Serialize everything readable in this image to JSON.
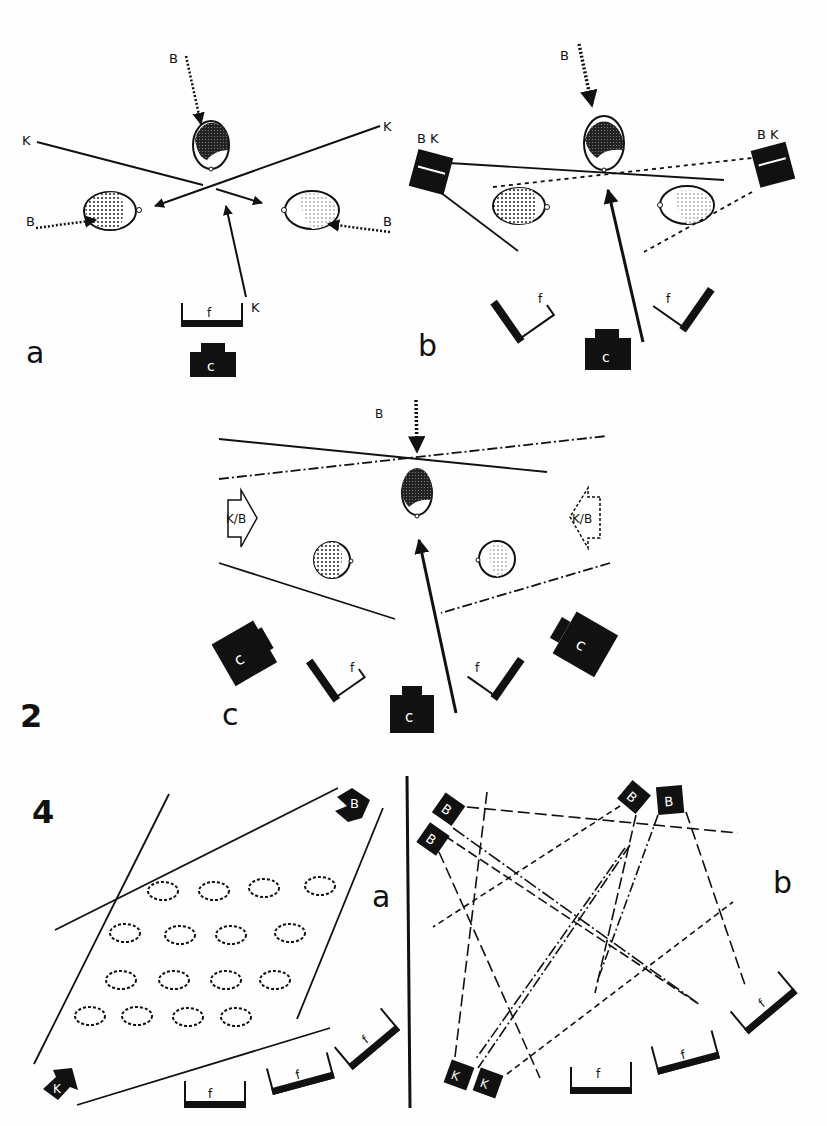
{
  "figure_2": {
    "number": "2",
    "panels": {
      "a": {
        "label": "a",
        "back_light": "B",
        "key_light": "K",
        "fill": "f"
      },
      "b": {
        "label": "b",
        "back_light": "B",
        "backkey_left": "B K",
        "backkey_right": "B K",
        "fill": "f"
      },
      "c": {
        "label": "c",
        "back_light": "B",
        "keyback_left": "K/B",
        "keyback_right": "K/B",
        "fill": "f",
        "camera_glyph": "C"
      }
    }
  },
  "figure_4": {
    "number": "4",
    "panels": {
      "a": {
        "label": "a",
        "back_light": "B",
        "key_light": "K",
        "fill": "f"
      },
      "b": {
        "label": "b",
        "back_light": "B",
        "key_light": "K",
        "fill": "f"
      }
    }
  },
  "legend": {
    "B": "back light",
    "K": "key light",
    "f": "fill light",
    "C": "camera"
  },
  "colors": {
    "ink": "#111111",
    "paper": "#fefefe",
    "dot": "#555555"
  }
}
